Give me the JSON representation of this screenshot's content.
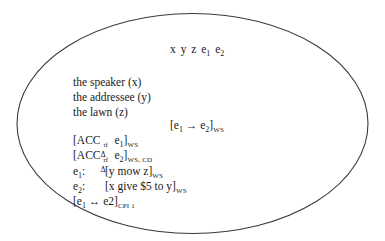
{
  "diagram": {
    "type": "discourse-representation-structure",
    "shape": "ellipse",
    "border_color": "#333333",
    "universe": {
      "referents": [
        "x",
        "y",
        "z",
        "e1",
        "e2"
      ],
      "display": [
        {
          "base": "x"
        },
        {
          "base": "y"
        },
        {
          "base": "z"
        },
        {
          "base": "e",
          "sub": "1"
        },
        {
          "base": "e",
          "sub": "2"
        }
      ]
    },
    "conditions": {
      "referent_descriptions": [
        {
          "text": "the speaker (x)"
        },
        {
          "text": "the addressee (y)"
        },
        {
          "text": "the lawn (z)"
        }
      ],
      "relation": {
        "open": "[e",
        "sub1": "1",
        "arrow": "→",
        "mid": "e",
        "sub2": "2",
        "close": "]",
        "subscript": "WS"
      },
      "acc_1": {
        "open": "[ACC",
        "sub": "Δ",
        "sup": "tf",
        "arg": "e",
        "arg_sub": "1",
        "close": "]",
        "subscript": "WS"
      },
      "acc_2": {
        "open": "[ACC",
        "sub": "Δ",
        "sup": "rf",
        "arg": "e",
        "arg_sub": "2",
        "close": "]",
        "subscript": "WS, CD"
      },
      "event_1": {
        "label": "e",
        "label_sub": "1",
        "colon": ":",
        "content": "[y mow z]",
        "subscript": "WS"
      },
      "event_2": {
        "label": "e",
        "label_sub": "2",
        "colon": ":",
        "content": "[x give $5 to y]",
        "subscript": "WS"
      },
      "biconditional": {
        "open": "[e",
        "sub1": "1",
        "arrow": "↔",
        "mid": "e2",
        "close": "]",
        "subscript": "CPI 1"
      }
    }
  }
}
